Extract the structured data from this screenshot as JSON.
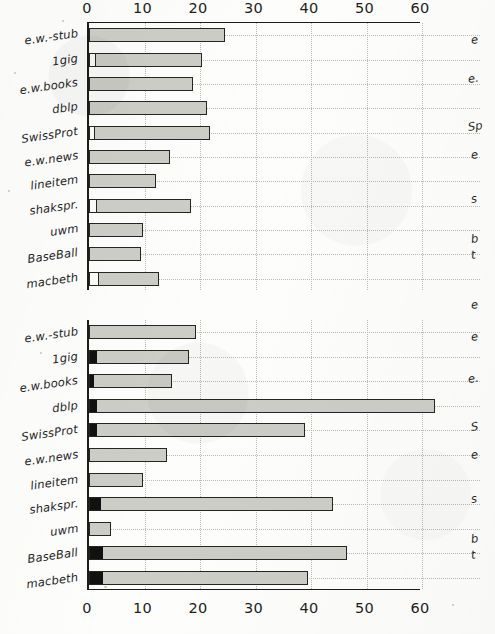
{
  "figure": {
    "kind": "two stacked horizontal bar charts (scanned figure)",
    "axis_ticks": [
      "0",
      "10",
      "20",
      "30",
      "40",
      "50",
      "60"
    ],
    "categories": [
      "e.w.-stub",
      "1gig",
      "e.w.books",
      "dblp",
      "SwissProt",
      "e.w.news",
      "lineitem",
      "shakspr.",
      "uwm",
      "BaseBall",
      "macbeth"
    ],
    "colors": {
      "bar_fill": "#cdcdc7",
      "bar_outline": "#262620",
      "dark_segment": "#111110",
      "white_segment": "#fbfbf9",
      "gridline": "#b9b9b2",
      "axis": "#1c1c18",
      "paper": "#fdfdfc"
    },
    "cutoff_chart_fragments_upper": [
      "e",
      "e.",
      "Sp",
      "e",
      "s",
      "b",
      "t",
      "e"
    ],
    "cutoff_chart_fragments_lower": [
      "e",
      "e.",
      "S",
      "e",
      "s",
      "b",
      "t"
    ]
  },
  "chart_data": [
    {
      "type": "bar",
      "orientation": "horizontal",
      "title": "",
      "subtitle": "",
      "xlabel": "",
      "ylabel": "",
      "xlim": [
        0,
        60
      ],
      "xticks": [
        0,
        10,
        20,
        30,
        40,
        50,
        60
      ],
      "grid": true,
      "legend": "none",
      "categories": [
        "e.w.-stub",
        "1gig",
        "e.w.books",
        "dblp",
        "SwissProt",
        "e.w.news",
        "lineitem",
        "shakspr.",
        "uwm",
        "BaseBall",
        "macbeth"
      ],
      "values": [
        24.5,
        20.3,
        18.8,
        21.2,
        21.8,
        14.6,
        12.0,
        18.3,
        9.8,
        9.3,
        12.7
      ],
      "lead_segment_kind": [
        "none",
        "white",
        "none",
        "none",
        "white",
        "none",
        "none",
        "white",
        "none",
        "none",
        "white"
      ],
      "lead_segment_values": [
        0,
        1.1,
        0,
        0,
        0.9,
        0,
        0,
        1.2,
        0,
        0,
        1.7
      ]
    },
    {
      "type": "bar",
      "orientation": "horizontal",
      "title": "",
      "subtitle": "",
      "xlabel": "",
      "ylabel": "",
      "xlim": [
        0,
        60
      ],
      "xticks": [
        0,
        10,
        20,
        30,
        40,
        50,
        60
      ],
      "grid": true,
      "legend": "none",
      "categories": [
        "e.w.-stub",
        "1gig",
        "e.w.books",
        "dblp",
        "SwissProt",
        "e.w.news",
        "lineitem",
        "shakspr.",
        "uwm",
        "BaseBall",
        "macbeth"
      ],
      "values": [
        19.3,
        18.0,
        15.0,
        62.3,
        38.9,
        14.0,
        9.8,
        44.0,
        3.9,
        46.5,
        39.5
      ],
      "lead_segment_kind": [
        "none",
        "dark",
        "dark",
        "dark",
        "dark",
        "none",
        "none",
        "dark",
        "none",
        "dark",
        "dark"
      ],
      "lead_segment_values": [
        0,
        1.3,
        0.8,
        1.2,
        1.2,
        0,
        0,
        2.0,
        0,
        2.4,
        2.4
      ]
    }
  ],
  "axis_top": {
    "ticks": [
      "0",
      "10",
      "20",
      "30",
      "40",
      "50",
      "60"
    ]
  },
  "axis_bottom": {
    "ticks": [
      "0",
      "10",
      "20",
      "30",
      "40",
      "50",
      "60"
    ]
  }
}
